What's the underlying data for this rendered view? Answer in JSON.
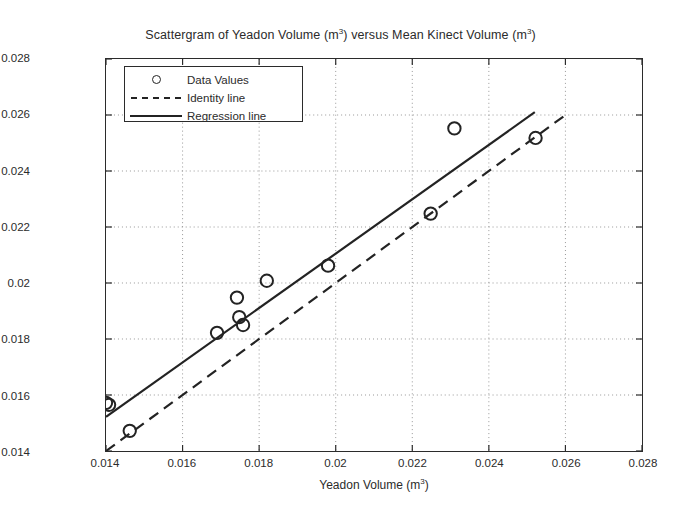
{
  "chart_data": {
    "type": "scatter",
    "title": "Scattergram of Yeadon Volume (m3) versus Mean Kinect Volume (m3)",
    "title_main": "Scattergram of Yeadon Volume (m",
    "title_mid": ") versus Mean Kinect Volume (m",
    "title_end": ")",
    "superscript": "3",
    "xlabel_main": "Yeadon Volume (m",
    "xlabel_end": ")",
    "ylabel_main": "Mean Kinect Volume (m",
    "ylabel_end": ")",
    "xlim": [
      0.014,
      0.028
    ],
    "ylim": [
      0.014,
      0.028
    ],
    "xticks": [
      "0.014",
      "0.016",
      "0.018",
      "0.02",
      "0.022",
      "0.024",
      "0.026",
      "0.028"
    ],
    "yticks": [
      "0.014",
      "0.016",
      "0.018",
      "0.02",
      "0.022",
      "0.024",
      "0.026",
      "0.028"
    ],
    "xtick_values": [
      0.014,
      0.016,
      0.018,
      0.02,
      0.022,
      0.024,
      0.026,
      0.028
    ],
    "ytick_values": [
      0.014,
      0.016,
      0.018,
      0.02,
      0.022,
      0.024,
      0.026,
      0.028
    ],
    "grid": true,
    "grid_style": "dotted",
    "legend_position": "upper-left",
    "series": [
      {
        "name": "Data Values",
        "type": "scatter",
        "marker": "open-circle",
        "color": "#232323",
        "points": [
          {
            "x": 0.014,
            "y": 0.01572
          },
          {
            "x": 0.01408,
            "y": 0.01565
          },
          {
            "x": 0.01462,
            "y": 0.01472
          },
          {
            "x": 0.0169,
            "y": 0.01822
          },
          {
            "x": 0.01742,
            "y": 0.01948
          },
          {
            "x": 0.01748,
            "y": 0.01878
          },
          {
            "x": 0.01758,
            "y": 0.0185
          },
          {
            "x": 0.0182,
            "y": 0.02008
          },
          {
            "x": 0.0198,
            "y": 0.02062
          },
          {
            "x": 0.02248,
            "y": 0.02248
          },
          {
            "x": 0.0231,
            "y": 0.02552
          },
          {
            "x": 0.02522,
            "y": 0.02518
          }
        ]
      },
      {
        "name": "Identity line",
        "type": "line",
        "style": "dashed",
        "color": "#232323",
        "x": [
          0.014,
          0.026
        ],
        "y": [
          0.014,
          0.026
        ]
      },
      {
        "name": "Regression line",
        "type": "line",
        "style": "solid",
        "color": "#232323",
        "x": [
          0.014,
          0.0252
        ],
        "y": [
          0.01522,
          0.0261
        ]
      }
    ]
  },
  "legend": {
    "items": [
      {
        "label": "Data Values",
        "key": "open-circle"
      },
      {
        "label": "Identity line",
        "key": "dashed-line"
      },
      {
        "label": "Regression line",
        "key": "solid-line"
      }
    ]
  }
}
